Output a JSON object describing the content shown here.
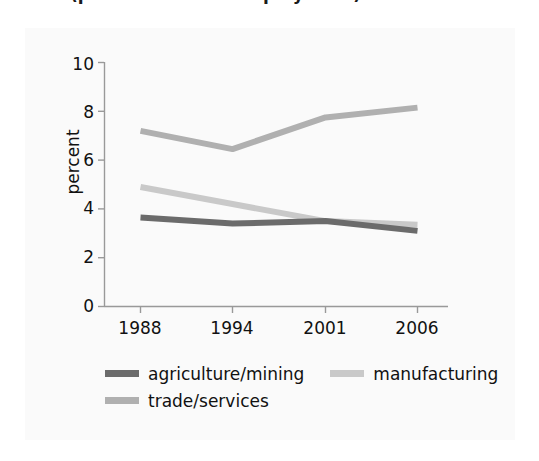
{
  "figure": {
    "title_partial": "(percent of total employment)",
    "panel_bg": "#fafafa"
  },
  "axes": {
    "ylabel": "percent",
    "yticks": [
      "0",
      "2",
      "4",
      "6",
      "8",
      "10"
    ],
    "xticks": [
      "1988",
      "1994",
      "2001",
      "2006"
    ]
  },
  "legend": {
    "items": [
      {
        "label": "agriculture/mining",
        "color": "#6b6b6b"
      },
      {
        "label": "manufacturing",
        "color": "#c9c9c9"
      },
      {
        "label": "trade/services",
        "color": "#b0b0b0"
      }
    ]
  },
  "chart_data": {
    "type": "line",
    "title": "(percent of total employment)",
    "xlabel": "",
    "ylabel": "percent",
    "categories": [
      "1988",
      "1994",
      "2001",
      "2006"
    ],
    "ylim": [
      0,
      10
    ],
    "ytick_step": 2,
    "grid": false,
    "legend_position": "bottom",
    "series": [
      {
        "name": "agriculture/mining",
        "color": "#6b6b6b",
        "values": [
          3.65,
          3.4,
          3.5,
          3.1
        ]
      },
      {
        "name": "manufacturing",
        "color": "#c9c9c9",
        "values": [
          4.9,
          4.2,
          3.5,
          3.35
        ]
      },
      {
        "name": "trade/services",
        "color": "#b0b0b0",
        "values": [
          7.2,
          6.45,
          7.75,
          8.15
        ]
      }
    ]
  }
}
